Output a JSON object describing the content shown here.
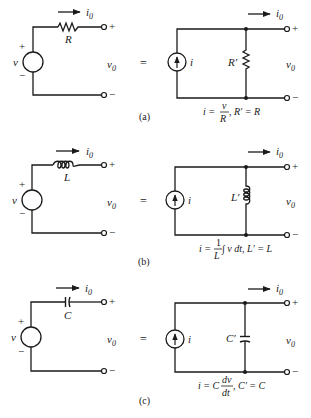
{
  "figure": {
    "panels": [
      {
        "id": "a",
        "caption": "(a)",
        "left": {
          "source_label": "v",
          "source_plus": "+",
          "source_minus": "−",
          "element_label": "R",
          "element_type": "resistor",
          "current_label": "i",
          "current_sub": "0",
          "output_label": "v",
          "output_sub": "0",
          "terminal_plus": "+",
          "terminal_minus": "−"
        },
        "equals": "=",
        "right": {
          "source_label": "i",
          "element_label": "R′",
          "element_type": "resistor",
          "current_label": "i",
          "current_sub": "0",
          "output_label": "v",
          "output_sub": "0",
          "terminal_plus": "+",
          "terminal_minus": "−",
          "formula_lhs": "i = ",
          "formula_num": "v",
          "formula_den": "R",
          "formula_rhs": ", R′ = R"
        }
      },
      {
        "id": "b",
        "caption": "(b)",
        "left": {
          "source_label": "v",
          "source_plus": "+",
          "source_minus": "−",
          "element_label": "L",
          "element_type": "inductor",
          "current_label": "i",
          "current_sub": "0",
          "output_label": "v",
          "output_sub": "0",
          "terminal_plus": "+",
          "terminal_minus": "−"
        },
        "equals": "=",
        "right": {
          "source_label": "i",
          "element_label": "L′",
          "element_type": "inductor",
          "current_label": "i",
          "current_sub": "0",
          "output_label": "v",
          "output_sub": "0",
          "terminal_plus": "+",
          "terminal_minus": "−",
          "formula_lhs": "i = ",
          "formula_num": "1",
          "formula_den": "L",
          "formula_rhs": " ∫ v dt, L′ = L"
        }
      },
      {
        "id": "c",
        "caption": "(c)",
        "left": {
          "source_label": "v",
          "source_plus": "+",
          "source_minus": "−",
          "element_label": "C",
          "element_type": "capacitor",
          "current_label": "i",
          "current_sub": "0",
          "output_label": "v",
          "output_sub": "0",
          "terminal_plus": "+",
          "terminal_minus": "−"
        },
        "equals": "=",
        "right": {
          "source_label": "i",
          "element_label": "C′",
          "element_type": "capacitor",
          "current_label": "i",
          "current_sub": "0",
          "output_label": "v",
          "output_sub": "0",
          "terminal_plus": "+",
          "terminal_minus": "−",
          "formula_lhs": "i = C",
          "formula_num": "dv",
          "formula_den": "dt",
          "formula_rhs": ", C′ = C"
        }
      }
    ]
  }
}
